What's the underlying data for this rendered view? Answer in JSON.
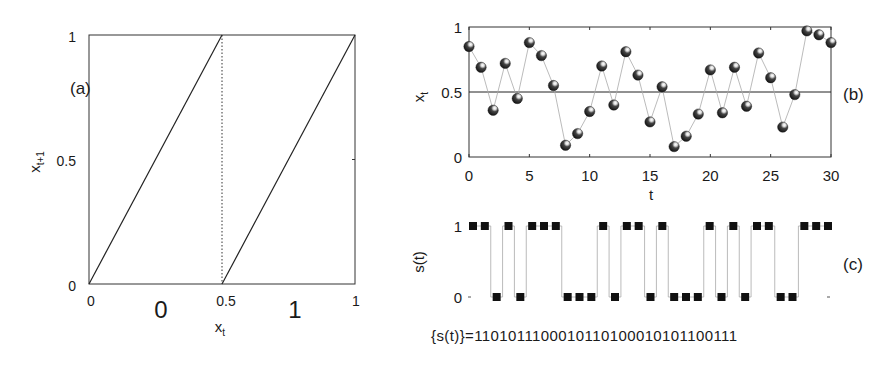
{
  "chart_data": [
    {
      "panel": "(a)",
      "type": "line",
      "title": "",
      "xlabel": "x_t",
      "ylabel": "x_{t+1}",
      "xlim": [
        0,
        1
      ],
      "ylim": [
        0,
        1
      ],
      "xticks": [
        "0",
        "0.5",
        "1"
      ],
      "yticks": [
        "0",
        "0.5",
        "1"
      ],
      "region_labels": [
        "0",
        "1"
      ],
      "series": [
        {
          "name": "branch-left",
          "x": [
            0,
            0.5
          ],
          "y": [
            0,
            1
          ]
        },
        {
          "name": "branch-right",
          "x": [
            0.5,
            1
          ],
          "y": [
            0,
            1
          ]
        }
      ],
      "divider": {
        "x": 0.5,
        "style": "dotted"
      }
    },
    {
      "panel": "(b)",
      "type": "line",
      "title": "",
      "xlabel": "t",
      "ylabel": "x_t",
      "xlim": [
        0,
        30
      ],
      "ylim": [
        0,
        1
      ],
      "xticks": [
        "0",
        "5",
        "10",
        "15",
        "20",
        "25",
        "30"
      ],
      "yticks": [
        "0",
        "0.5",
        "1"
      ],
      "threshold": 0.5,
      "x": [
        0,
        1,
        2,
        3,
        4,
        5,
        6,
        7,
        8,
        9,
        10,
        11,
        12,
        13,
        14,
        15,
        16,
        17,
        18,
        19,
        20,
        21,
        22,
        23,
        24,
        25,
        26,
        27,
        28,
        29,
        30
      ],
      "values": [
        0.85,
        0.69,
        0.36,
        0.72,
        0.45,
        0.88,
        0.78,
        0.55,
        0.09,
        0.18,
        0.35,
        0.7,
        0.4,
        0.81,
        0.63,
        0.27,
        0.54,
        0.08,
        0.16,
        0.33,
        0.67,
        0.34,
        0.69,
        0.39,
        0.8,
        0.61,
        0.23,
        0.48,
        0.97,
        0.94,
        0.88
      ]
    },
    {
      "panel": "(c)",
      "type": "line",
      "title": "",
      "xlabel": "",
      "ylabel": "s(t)",
      "xlim": [
        0,
        30
      ],
      "ylim": [
        0,
        1
      ],
      "yticks": [
        "0",
        "1"
      ],
      "x": [
        0,
        1,
        2,
        3,
        4,
        5,
        6,
        7,
        8,
        9,
        10,
        11,
        12,
        13,
        14,
        15,
        16,
        17,
        18,
        19,
        20,
        21,
        22,
        23,
        24,
        25,
        26,
        27,
        28,
        29,
        30
      ],
      "values": [
        1,
        1,
        0,
        1,
        0,
        1,
        1,
        1,
        0,
        0,
        0,
        1,
        0,
        1,
        1,
        0,
        1,
        0,
        0,
        0,
        1,
        0,
        1,
        0,
        1,
        1,
        0,
        0,
        1,
        1,
        1
      ],
      "sequence_text": "{s(t)}=1101011100010110100010101100111"
    }
  ]
}
